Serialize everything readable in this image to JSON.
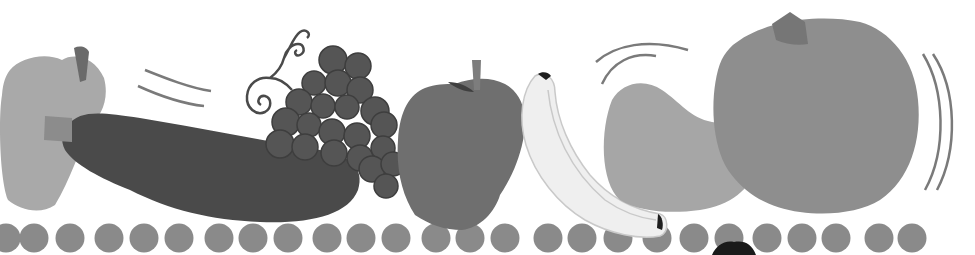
{
  "scene": {
    "title": "Fruit and vegetable border illustration",
    "width": 975,
    "height": 255,
    "background": "#ffffff"
  },
  "colors": {
    "bell_pepper": "#a9a9a9",
    "pepper_stem": "#6a6a6a",
    "zucchini": "#4a4a4a",
    "zucchini_stem": "#8c8c8c",
    "grape": "#555555",
    "grape_outline": "#3e3e3e",
    "vine": "#4a4a4a",
    "apple": "#6f6f6f",
    "apple_stem": "#7d7d7d",
    "banana": "#efefef",
    "banana_outline": "#c9c9c9",
    "banana_tip": "#1e1e1e",
    "pear": "#a6a6a6",
    "pear_stem": "#6d6d6d",
    "pumpkin": "#8e8e8e",
    "pumpkin_stem": "#767676",
    "motion_lines": "#7a7a7a",
    "dots": "#8a8a8a",
    "black_blob": "#1a1a1a"
  },
  "items": [
    {
      "name": "bell-pepper",
      "label": "Bell pepper"
    },
    {
      "name": "zucchini",
      "label": "Zucchini"
    },
    {
      "name": "grapes",
      "label": "Grapes"
    },
    {
      "name": "apple",
      "label": "Apple"
    },
    {
      "name": "banana",
      "label": "Banana"
    },
    {
      "name": "pear",
      "label": "Pear"
    },
    {
      "name": "pumpkin",
      "label": "Pumpkin"
    }
  ],
  "dots": {
    "y": 238,
    "r": 14.5,
    "x": [
      6,
      34,
      70,
      109,
      144,
      179,
      219,
      253,
      288,
      327,
      361,
      396,
      436,
      470,
      505,
      548,
      582,
      618,
      657,
      694,
      729,
      767,
      802,
      836,
      879,
      912
    ]
  },
  "grapes": [
    [
      333,
      60,
      14
    ],
    [
      358,
      66,
      13
    ],
    [
      314,
      83,
      12
    ],
    [
      338,
      83,
      13
    ],
    [
      360,
      90,
      13
    ],
    [
      299,
      102,
      13
    ],
    [
      323,
      106,
      12
    ],
    [
      347,
      107,
      12
    ],
    [
      375,
      111,
      14
    ],
    [
      286,
      122,
      14
    ],
    [
      309,
      125,
      12
    ],
    [
      332,
      132,
      13
    ],
    [
      357,
      136,
      13
    ],
    [
      384,
      125,
      13
    ],
    [
      280,
      144,
      14
    ],
    [
      305,
      147,
      13
    ],
    [
      334,
      153,
      13
    ],
    [
      360,
      158,
      13
    ],
    [
      383,
      148,
      12
    ],
    [
      372,
      169,
      13
    ],
    [
      393,
      164,
      12
    ],
    [
      386,
      186,
      12
    ]
  ]
}
